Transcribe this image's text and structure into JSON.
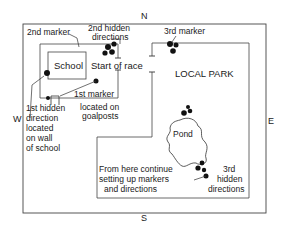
{
  "compass": {
    "north": "N",
    "south": "S",
    "east": "E",
    "west": "W"
  },
  "places": {
    "school": "School",
    "park": "LOCAL PARK",
    "pond": "Pond",
    "start": "Start of race"
  },
  "labels": {
    "second_marker": "2nd marker",
    "second_hidden": [
      "2nd hidden",
      "directions"
    ],
    "third_marker": "3rd marker",
    "first_marker": "1st marker",
    "first_marker_note": [
      "located on",
      "goalposts"
    ],
    "first_hidden": [
      "1st hidden",
      "direction",
      "located",
      "on wall",
      "of school"
    ],
    "continue_note": [
      "From here continue",
      "setting up markers",
      "and directions"
    ],
    "third_hidden": [
      "3rd",
      "hidden",
      "directions"
    ]
  },
  "colors": {
    "line": "#333333",
    "ink": "#111111",
    "background": "#ffffff"
  }
}
